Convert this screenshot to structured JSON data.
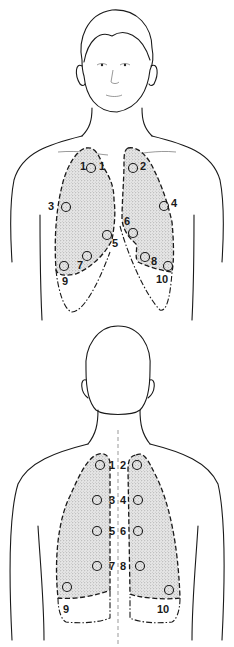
{
  "figure": {
    "views": [
      {
        "name": "anterior",
        "points": [
          {
            "label": "1",
            "x": 91,
            "y": 168,
            "lx": 82,
            "ly": 161
          },
          {
            "label": "2",
            "x": 133,
            "y": 168,
            "lx": 140,
            "ly": 161
          },
          {
            "label": "3",
            "x": 66,
            "y": 207,
            "lx": 49,
            "ly": 201
          },
          {
            "label": "4",
            "x": 164,
            "y": 206,
            "lx": 171,
            "ly": 198
          },
          {
            "label": "5",
            "x": 107,
            "y": 235,
            "lx": 112,
            "ly": 238
          },
          {
            "label": "6",
            "x": 133,
            "y": 233,
            "lx": 124,
            "ly": 216
          },
          {
            "label": "7",
            "x": 87,
            "y": 256,
            "lx": 77,
            "ly": 260
          },
          {
            "label": "8",
            "x": 145,
            "y": 257,
            "lx": 151,
            "ly": 258
          },
          {
            "label": "9",
            "x": 64,
            "y": 266,
            "lx": 61,
            "ly": 277
          },
          {
            "label": "10",
            "x": 168,
            "y": 266,
            "lx": 156,
            "ly": 275
          }
        ],
        "extra_label": {
          "label": "1",
          "lx": 99,
          "ly": 161
        }
      },
      {
        "name": "posterior",
        "points": [
          {
            "label": "1",
            "x": 100,
            "y": 465,
            "lx": 109,
            "ly": 460
          },
          {
            "label": "2",
            "x": 137,
            "y": 465,
            "lx": 120,
            "ly": 460
          },
          {
            "label": "3",
            "x": 97,
            "y": 500,
            "lx": 109,
            "ly": 495
          },
          {
            "label": "4",
            "x": 138,
            "y": 500,
            "lx": 120,
            "ly": 495
          },
          {
            "label": "5",
            "x": 97,
            "y": 531,
            "lx": 109,
            "ly": 526
          },
          {
            "label": "6",
            "x": 138,
            "y": 531,
            "lx": 120,
            "ly": 526
          },
          {
            "label": "7",
            "x": 97,
            "y": 566,
            "lx": 109,
            "ly": 561
          },
          {
            "label": "8",
            "x": 140,
            "y": 566,
            "lx": 120,
            "ly": 561
          },
          {
            "label": "9",
            "x": 67,
            "y": 587,
            "lx": 62,
            "ly": 604
          },
          {
            "label": "10",
            "x": 169,
            "y": 590,
            "lx": 157,
            "ly": 604
          }
        ]
      }
    ]
  }
}
